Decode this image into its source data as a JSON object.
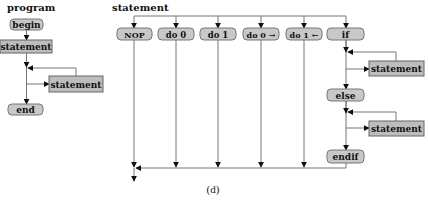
{
  "figure": {
    "caption": "(d)",
    "program": {
      "title": "program",
      "nodes": {
        "begin": "begin",
        "statement1": "statement",
        "statement_loop": "statement",
        "end": "end"
      }
    },
    "statement": {
      "title": "statement",
      "branches": [
        "NOP",
        "do 0",
        "do 1",
        "do 0 →",
        "do 1 ←",
        "if"
      ],
      "if_chain": {
        "then_statement": "statement",
        "else": "else",
        "else_statement": "statement",
        "endif": "endif"
      }
    }
  }
}
